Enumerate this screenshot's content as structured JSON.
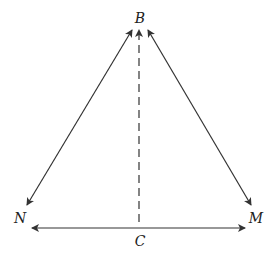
{
  "diagram": {
    "labels": {
      "B": "B",
      "N": "N",
      "M": "M",
      "C": "C"
    },
    "colors": {
      "line": "#333333"
    }
  }
}
